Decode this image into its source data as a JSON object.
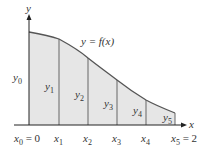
{
  "diagram": {
    "type": "trapezoidal-rule-area-under-curve",
    "axes": {
      "x_label": "x",
      "y_label": "y"
    },
    "curve_label": "y = f(x)",
    "colors": {
      "fill": "#e6e6e6",
      "line": "#555555",
      "axis": "#222222",
      "text": "#333333"
    },
    "ordinates": [
      {
        "name": "y",
        "sub": "0"
      },
      {
        "name": "y",
        "sub": "1"
      },
      {
        "name": "y",
        "sub": "2"
      },
      {
        "name": "y",
        "sub": "3"
      },
      {
        "name": "y",
        "sub": "4"
      },
      {
        "name": "y",
        "sub": "5"
      }
    ],
    "x_ticks": [
      {
        "name": "x",
        "sub": "0",
        "suffix": " = 0"
      },
      {
        "name": "x",
        "sub": "1",
        "suffix": ""
      },
      {
        "name": "x",
        "sub": "2",
        "suffix": ""
      },
      {
        "name": "x",
        "sub": "3",
        "suffix": ""
      },
      {
        "name": "x",
        "sub": "4",
        "suffix": ""
      },
      {
        "name": "x",
        "sub": "5",
        "suffix": " = 2"
      }
    ]
  }
}
